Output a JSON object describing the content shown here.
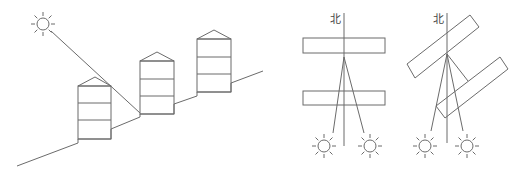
{
  "figure": {
    "panels": [
      {
        "id": "slope-section",
        "description": "Three buildings on slope with sun ray grazing rooftop",
        "sun": {
          "cx": 43,
          "cy": 24,
          "r": 6
        },
        "ray": {
          "x1": 51,
          "y1": 31,
          "x2": 140,
          "y2": 113
        },
        "ground": [
          [
            17,
            166
          ],
          [
            78,
            143
          ],
          [
            78,
            139
          ],
          [
            111,
            139
          ],
          [
            111,
            129
          ],
          [
            140,
            117
          ],
          [
            140,
            114
          ],
          [
            174,
            114
          ],
          [
            174,
            104
          ],
          [
            197,
            96
          ],
          [
            197,
            92
          ],
          [
            231,
            92
          ],
          [
            231,
            83
          ],
          [
            263,
            71
          ]
        ],
        "buildings": [
          {
            "x": 78,
            "eave": 86,
            "bottom": 139,
            "w": 33,
            "peak": 77,
            "floors": [
              103,
              120
            ]
          },
          {
            "x": 140,
            "eave": 61,
            "bottom": 114,
            "w": 34,
            "peak": 52,
            "floors": [
              79,
              96
            ]
          },
          {
            "x": 197,
            "eave": 39,
            "bottom": 92,
            "w": 34,
            "peak": 30,
            "floors": [
              57,
              74
            ]
          }
        ]
      },
      {
        "id": "parallel-plan",
        "north_label": "北",
        "north_label_pos": [
          332,
          22
        ],
        "north_line": {
          "x": 344,
          "y1": 13,
          "y2": 146
        }
      },
      {
        "id": "rotated-plan",
        "north_label": "北",
        "north_label_pos": [
          435,
          22
        ],
        "north_line": {
          "x": 447,
          "y1": 13,
          "y2": 143
        }
      }
    ],
    "colors": {
      "stroke": "#6b6b6b",
      "background": "#ffffff"
    }
  }
}
